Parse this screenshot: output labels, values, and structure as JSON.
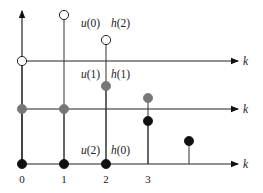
{
  "diagram": {
    "type": "discrete-convolution-stem-plot",
    "colors": {
      "open": "#ffffff",
      "gray": "#777777",
      "black": "#111111",
      "line": "#222222"
    },
    "axes": [
      {
        "name": "top-axis",
        "y": 61,
        "label": "k"
      },
      {
        "name": "middle-axis",
        "y": 109,
        "label": "k"
      },
      {
        "name": "bottom-axis",
        "y": 164,
        "label": "k"
      }
    ],
    "x_ticks": [
      {
        "x": 22,
        "label": "0"
      },
      {
        "x": 64,
        "label": "1"
      },
      {
        "x": 106,
        "label": "2"
      },
      {
        "x": 148,
        "label": "3"
      }
    ],
    "annotations": [
      {
        "text": "u(0)",
        "x": 81,
        "y": 27
      },
      {
        "text": "h(2)",
        "x": 111,
        "y": 27
      },
      {
        "text": "u(1)",
        "x": 81,
        "y": 78
      },
      {
        "text": "h(1)",
        "x": 111,
        "y": 78
      },
      {
        "text": "u(2)",
        "x": 81,
        "y": 154
      },
      {
        "text": "h(0)",
        "x": 111,
        "y": 154
      }
    ],
    "stems": [
      {
        "row": "bottom",
        "x": 22,
        "tip_y": 164,
        "fill": "black"
      },
      {
        "row": "bottom",
        "x": 64,
        "tip_y": 164,
        "fill": "black"
      },
      {
        "row": "bottom",
        "x": 106,
        "tip_y": 164,
        "fill": "black"
      },
      {
        "row": "bottom",
        "x": 148,
        "tip_y": 121,
        "fill": "black"
      },
      {
        "row": "bottom",
        "x": 189,
        "tip_y": 141,
        "fill": "black"
      },
      {
        "row": "middle",
        "x": 22,
        "tip_y": 109,
        "fill": "gray"
      },
      {
        "row": "middle",
        "x": 64,
        "tip_y": 109,
        "fill": "gray"
      },
      {
        "row": "middle",
        "x": 106,
        "tip_y": 86,
        "fill": "gray"
      },
      {
        "row": "middle",
        "x": 148,
        "tip_y": 98,
        "fill": "gray"
      },
      {
        "row": "top",
        "x": 22,
        "tip_y": 61,
        "fill": "open"
      },
      {
        "row": "top",
        "x": 64,
        "tip_y": 15,
        "fill": "open"
      },
      {
        "row": "top",
        "x": 106,
        "tip_y": 40,
        "fill": "open"
      }
    ],
    "vertical_axis": {
      "x": 22,
      "top": 9,
      "bottom": 164
    }
  }
}
